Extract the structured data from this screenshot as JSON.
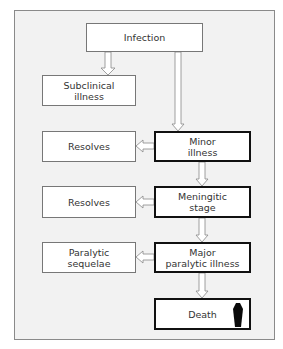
{
  "colors": {
    "background": "#f2f2f2",
    "box_fill": "#ffffff",
    "thin_border": "#777777",
    "thick_border": "#111111",
    "text": "#333333"
  },
  "nodes": {
    "infection": {
      "label": "Infection"
    },
    "subclinical": {
      "label": "Subclinical\nillness"
    },
    "resolves_1": {
      "label": "Resolves"
    },
    "minor_illness": {
      "label": "Minor\nillness"
    },
    "resolves_2": {
      "label": "Resolves"
    },
    "meningitic_stage": {
      "label": "Meningitic\nstage"
    },
    "paralytic_sequelae": {
      "label": "Paralytic\nsequelae"
    },
    "major_paralytic": {
      "label": "Major\nparalytic illness"
    },
    "death": {
      "label": "Death",
      "icon": "coffin-icon"
    }
  },
  "edges": [
    {
      "from": "Infection",
      "to": "Subclinical illness"
    },
    {
      "from": "Infection",
      "to": "Minor illness"
    },
    {
      "from": "Minor illness",
      "to": "Resolves"
    },
    {
      "from": "Minor illness",
      "to": "Meningitic stage"
    },
    {
      "from": "Meningitic stage",
      "to": "Resolves"
    },
    {
      "from": "Meningitic stage",
      "to": "Major paralytic illness"
    },
    {
      "from": "Major paralytic illness",
      "to": "Paralytic sequelae"
    },
    {
      "from": "Major paralytic illness",
      "to": "Death"
    }
  ]
}
